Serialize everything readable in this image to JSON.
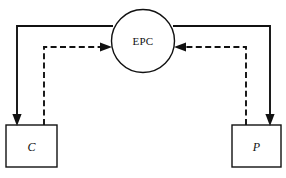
{
  "diagram": {
    "background_color": "#ffffff",
    "stroke_color": "#111111",
    "nodes": [
      {
        "id": "hub",
        "shape": "circle",
        "label": "EPC",
        "cx": 143,
        "cy": 41,
        "r": 31.5
      },
      {
        "id": "consumer",
        "shape": "rectangle",
        "label": "C",
        "x": 6,
        "y": 125,
        "width": 51,
        "height": 42
      },
      {
        "id": "producer",
        "shape": "rectangle",
        "label": "P",
        "x": 232,
        "y": 125,
        "width": 49,
        "height": 42
      }
    ],
    "edges": [
      {
        "id": "hub-to-consumer",
        "style": "solid",
        "from": "hub",
        "to": "consumer",
        "arrow": "to"
      },
      {
        "id": "hub-to-producer",
        "style": "solid",
        "from": "hub",
        "to": "producer",
        "arrow": "to"
      },
      {
        "id": "consumer-to-hub",
        "style": "dashed",
        "from": "consumer",
        "to": "hub",
        "arrow": "to"
      },
      {
        "id": "producer-to-hub",
        "style": "dashed",
        "from": "producer",
        "to": "hub",
        "arrow": "to"
      }
    ]
  }
}
